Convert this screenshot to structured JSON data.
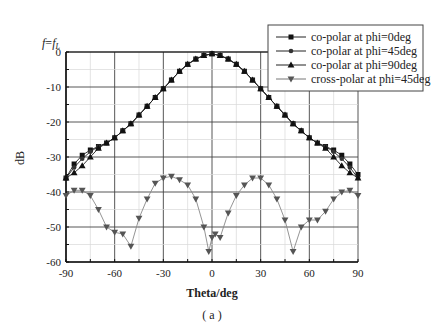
{
  "annotation": "f=fL",
  "caption": "( a )",
  "chart_data": {
    "type": "line",
    "title": "",
    "annotation": "f=fL",
    "xlabel": "Theta/deg",
    "ylabel": "dB",
    "xlim": [
      -90,
      90
    ],
    "ylim": [
      -60,
      0
    ],
    "xticks": [
      -90,
      -60,
      -30,
      0,
      30,
      60,
      90
    ],
    "yticks": [
      0,
      -10,
      -20,
      -30,
      -40,
      -50,
      -60
    ],
    "grid": true,
    "legend_position": "upper right",
    "series": [
      {
        "name": "co-polar at phi=0deg",
        "marker": "square",
        "x": [
          -90,
          -85,
          -80,
          -75,
          -70,
          -65,
          -60,
          -55,
          -50,
          -45,
          -40,
          -35,
          -30,
          -25,
          -20,
          -15,
          -10,
          -5,
          0,
          5,
          10,
          15,
          20,
          25,
          30,
          35,
          40,
          45,
          50,
          55,
          60,
          65,
          70,
          75,
          80,
          85,
          90
        ],
        "values": [
          -36,
          -32,
          -29.5,
          -28,
          -27,
          -26,
          -24.5,
          -22.5,
          -20.5,
          -18,
          -15.5,
          -13,
          -10.5,
          -8,
          -5.5,
          -3.5,
          -2,
          -1,
          -0.5,
          -1,
          -2,
          -3.5,
          -5.5,
          -8,
          -10.5,
          -13,
          -15.5,
          -18,
          -20.5,
          -22.5,
          -24.5,
          -26,
          -27,
          -28,
          -29.5,
          -32,
          -35
        ]
      },
      {
        "name": "co-polar at phi=45deg",
        "marker": "circle",
        "x": [
          -90,
          -85,
          -80,
          -75,
          -70,
          -65,
          -60,
          -55,
          -50,
          -45,
          -40,
          -35,
          -30,
          -25,
          -20,
          -15,
          -10,
          -5,
          0,
          5,
          10,
          15,
          20,
          25,
          30,
          35,
          40,
          45,
          50,
          55,
          60,
          65,
          70,
          75,
          80,
          85,
          90
        ],
        "values": [
          -36,
          -33,
          -30.5,
          -28.5,
          -27,
          -26,
          -24.5,
          -22.5,
          -20.5,
          -18,
          -15.5,
          -13,
          -10.5,
          -8,
          -5.5,
          -3.5,
          -2,
          -1,
          -0.5,
          -1,
          -2,
          -3.5,
          -5.5,
          -8,
          -10.5,
          -13,
          -15.5,
          -18,
          -20.5,
          -22.5,
          -24.5,
          -26,
          -27,
          -28.5,
          -30.5,
          -33,
          -36
        ]
      },
      {
        "name": "co-polar at phi=90deg",
        "marker": "triangle-up",
        "x": [
          -90,
          -85,
          -80,
          -75,
          -70,
          -65,
          -60,
          -55,
          -50,
          -45,
          -40,
          -35,
          -30,
          -25,
          -20,
          -15,
          -10,
          -5,
          0,
          5,
          10,
          15,
          20,
          25,
          30,
          35,
          40,
          45,
          50,
          55,
          60,
          65,
          70,
          75,
          80,
          85,
          90
        ],
        "values": [
          -36,
          -34.5,
          -32.5,
          -30,
          -27.5,
          -26,
          -24.5,
          -22.5,
          -20.5,
          -18,
          -15.5,
          -13,
          -10.5,
          -8,
          -5.5,
          -3.5,
          -2,
          -1,
          -0.5,
          -1,
          -2,
          -3.5,
          -5.5,
          -8,
          -10.5,
          -13,
          -15.5,
          -18,
          -20.5,
          -22.5,
          -24.5,
          -26,
          -27.5,
          -30,
          -32.5,
          -34.5,
          -36
        ]
      },
      {
        "name": "cross-polar at phi=45deg",
        "marker": "triangle-down",
        "x": [
          -90,
          -85,
          -80,
          -75,
          -70,
          -65,
          -60,
          -55,
          -50,
          -45,
          -40,
          -35,
          -30,
          -25,
          -20,
          -15,
          -10,
          -5,
          -2,
          0,
          2,
          5,
          10,
          15,
          20,
          25,
          30,
          35,
          40,
          45,
          50,
          55,
          60,
          65,
          70,
          75,
          80,
          85,
          90
        ],
        "values": [
          -41,
          -39.5,
          -39.5,
          -41,
          -45,
          -50,
          -51.5,
          -52,
          -55.5,
          -47.5,
          -42,
          -37.5,
          -36,
          -35.5,
          -36.5,
          -38,
          -42,
          -50,
          -57,
          -53,
          -52,
          -53,
          -46,
          -41,
          -38,
          -36,
          -36,
          -38,
          -42,
          -48,
          -57,
          -50,
          -48,
          -48,
          -45.5,
          -42,
          -40,
          -39.5,
          -41
        ]
      }
    ]
  }
}
